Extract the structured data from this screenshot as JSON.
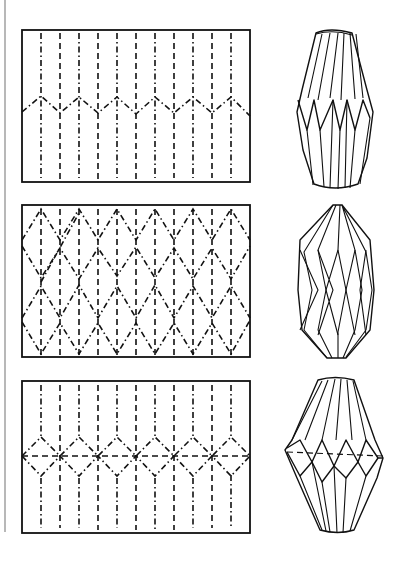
{
  "figure": {
    "colors": {
      "ink": "#111111",
      "paper": "#ffffff",
      "edge": "#b8b8b8"
    },
    "legend": {
      "mountain_fold": "dash-dot line",
      "valley_fold": "dashed line"
    },
    "panels": [
      {
        "id": "pattern-1",
        "label": "Single zigzag band",
        "rect": [
          22,
          30,
          250,
          182
        ],
        "vertical_creases": 11,
        "zigzag_rows": 1
      },
      {
        "id": "pattern-2",
        "label": "Diamond lattice",
        "rect": [
          22,
          205,
          250,
          357
        ],
        "vertical_creases": 11,
        "zigzag_rows": 4
      },
      {
        "id": "pattern-3",
        "label": "Diamond band with horizontal crease",
        "rect": [
          22,
          381,
          250,
          532
        ],
        "vertical_creases": 11,
        "zigzag_rows": 2
      }
    ],
    "models": [
      {
        "id": "lantern-1",
        "label": "Elongated lantern with zigzag waist"
      },
      {
        "id": "lantern-2",
        "label": "Lantern with diamond facets"
      },
      {
        "id": "lantern-3",
        "label": "Bulbous lantern with diamond belt"
      }
    ]
  }
}
